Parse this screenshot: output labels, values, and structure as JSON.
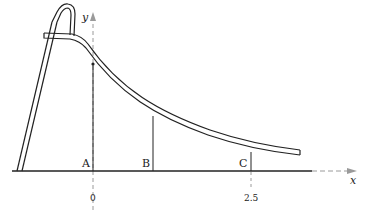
{
  "diagram": {
    "axes": {
      "x_label": "x",
      "y_label": "y"
    },
    "points": [
      {
        "id": "A",
        "label": "A"
      },
      {
        "id": "B",
        "label": "B"
      },
      {
        "id": "C",
        "label": "C"
      }
    ],
    "ticks": [
      {
        "label": "0"
      },
      {
        "label": "2.5"
      }
    ],
    "colors": {
      "line": "#222222",
      "dashed_axis": "#999999"
    }
  }
}
